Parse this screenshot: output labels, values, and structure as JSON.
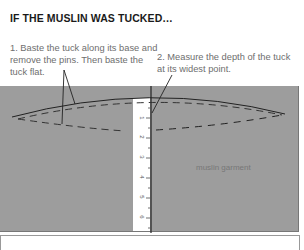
{
  "title": "IF THE MUSLIN WAS TUCKED…",
  "steps": [
    {
      "id": 1,
      "text": "1. Baste the tuck along its base and remove the pins. Then baste the tuck flat."
    },
    {
      "id": 2,
      "text": "2. Measure the depth of the tuck at its widest point."
    }
  ],
  "panel": {
    "label": "muslin garment",
    "color": "#9d9d9d"
  },
  "ruler": {
    "numbers": [
      "1",
      "2",
      "3",
      "4",
      "5",
      "6"
    ]
  }
}
